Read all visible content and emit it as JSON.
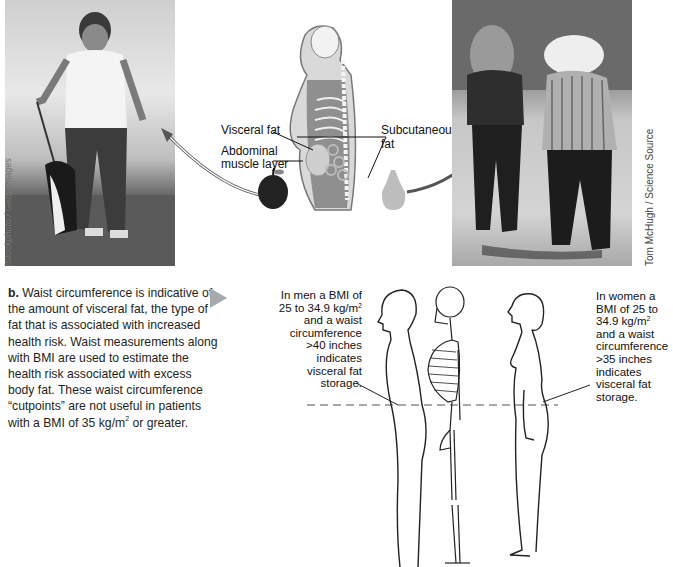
{
  "figure_a": {
    "photo_left": {
      "description": "overweight woman walking a dog",
      "credit": "iStockphoto / Getty Images"
    },
    "illustration": {
      "labels": {
        "visceral_fat": "Visceral fat",
        "abdominal_muscle": "Abdominal",
        "abdominal_muscle_2": "muscle layer",
        "subcutaneous": "Subcutaneous",
        "subcutaneous_2": "fat"
      },
      "icons": [
        "apple-icon",
        "pear-icon"
      ]
    },
    "photo_right": {
      "description": "two women walking, viewed from behind",
      "credit": "Tom McHugh / Science Source"
    }
  },
  "figure_b": {
    "caption_label": "b.",
    "caption_text": " Waist circumference is indicative of the amount of visceral fat, the type of fat that is associated with increased health risk. Waist measurements along with BMI are used to estimate the health risk associated with excess body fat. These waist circumference “cutpoints” are not useful in patients with a BMI of 35 kg/m",
    "caption_sup": "2",
    "caption_end": " or greater.",
    "note_men": {
      "l1": "In men a BMI of",
      "l2": "25 to 34.9 kg/m",
      "sup": "2",
      "l3": "and a waist",
      "l4": "circumference",
      "l5": ">40 inches",
      "l6": "indicates",
      "l7": "visceral fat",
      "l8": "storage."
    },
    "note_women": {
      "l1": "In women a",
      "l2": "BMI of 25 to",
      "l3": "34.9 kg/m",
      "sup": "2",
      "l4": "and a waist",
      "l5": "circumference",
      "l6": ">35 inches",
      "l7": "indicates",
      "l8": "visceral fat",
      "l9": "storage."
    }
  }
}
